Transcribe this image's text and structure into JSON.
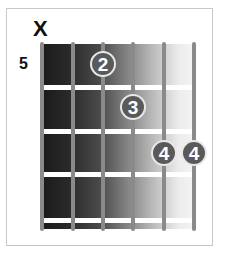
{
  "diagram": {
    "type": "guitar-chord-chart",
    "muted_marker": "X",
    "muted_string": 1,
    "start_fret_label": "5",
    "strings": 6,
    "frets_shown": 4,
    "fingers": [
      {
        "string": 3,
        "fret": 1,
        "finger": "2"
      },
      {
        "string": 4,
        "fret": 2,
        "finger": "3"
      },
      {
        "string": 5,
        "fret": 3,
        "finger": "4"
      },
      {
        "string": 6,
        "fret": 3,
        "finger": "4"
      }
    ]
  },
  "colors": {
    "board_dark": "#1a1a1a",
    "board_light": "#f4f4f4",
    "string": "#8a8a8a",
    "fret": "#ffffff",
    "dot": "#5a5a5a",
    "dot_border": "#e8e8e8"
  }
}
